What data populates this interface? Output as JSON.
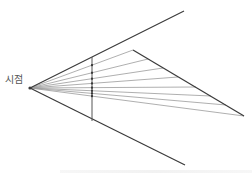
{
  "diagram": {
    "eye_label": "시점",
    "eye_point": [
      30,
      88
    ],
    "colors": {
      "outline": "#3a3a3a",
      "ray": "#9a9a9a",
      "picture_plane": "#555555",
      "label": "#555555"
    },
    "outer_lines": [
      {
        "name": "upper-visual-boundary",
        "from": [
          30,
          88
        ],
        "to": [
          184,
          11
        ]
      },
      {
        "name": "lower-visual-boundary",
        "from": [
          30,
          88
        ],
        "to": [
          185,
          165
        ]
      }
    ],
    "picture_plane": {
      "x": 92,
      "y1": 57,
      "y2": 121
    },
    "object_edge": {
      "from": [
        133,
        50
      ],
      "to": [
        244,
        116
      ]
    },
    "ray_targets": [
      [
        133,
        50
      ],
      [
        148,
        59
      ],
      [
        163,
        68
      ],
      [
        178,
        77
      ],
      [
        196,
        87
      ],
      [
        211,
        96
      ],
      [
        226,
        105
      ],
      [
        244,
        116
      ]
    ]
  }
}
